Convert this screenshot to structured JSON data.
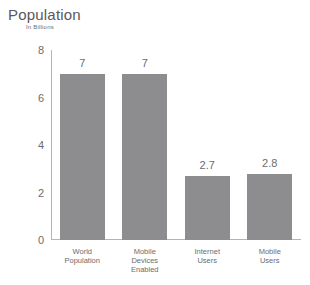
{
  "chart_data": {
    "type": "bar",
    "title": "Population",
    "subtitle": "In Billions",
    "xlabel": "",
    "ylabel": "",
    "ylim": [
      0,
      8
    ],
    "yticks": [
      0,
      2,
      4,
      6,
      8
    ],
    "grid": false,
    "legend": null,
    "bar_color": "#8d8d8f",
    "axis_color": "#b4b4b6",
    "text_color": "#6c6c6e",
    "categories": [
      "World Population",
      "Mobile Devices Enabled",
      "Internet Users",
      "Mobile Users"
    ],
    "category_lines": [
      [
        "World",
        "Population"
      ],
      [
        "Mobile",
        "Devices",
        "Enabled"
      ],
      [
        "Internet",
        "Users"
      ],
      [
        "Mobile",
        "Users"
      ]
    ],
    "values": [
      7,
      7,
      2.7,
      2.8
    ],
    "value_labels": [
      "7",
      "7",
      "2.7",
      "2.8"
    ]
  }
}
